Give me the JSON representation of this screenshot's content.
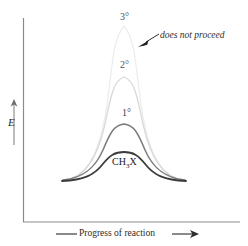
{
  "figure": {
    "type": "energy-diagram",
    "background_color": "#ffffff"
  },
  "axes": {
    "y_label": "E",
    "x_label": "Progress of reaction",
    "y_axis_name": "energy-axis",
    "x_axis_name": "reaction-coordinate-axis",
    "axis_color": "#6a6a6a",
    "y_axis_x": 23,
    "y_axis_top": 18,
    "y_axis_bottom": 222,
    "x_axis_left": 23,
    "x_axis_right": 240,
    "x_axis_y": 222
  },
  "annotation": {
    "text": "does not proceed",
    "arrow_from_x": 160,
    "arrow_from_y": 36,
    "arrow_to_x": 139,
    "arrow_to_y": 46
  },
  "chart_data": {
    "type": "line",
    "title": "",
    "xlabel": "Progress of reaction",
    "ylabel": "E",
    "grid": false,
    "legend": "inline-labels",
    "xlim": [
      0,
      1
    ],
    "ylim": [
      0,
      1
    ],
    "note": "Activation energy barriers for SN2 reaction with increasing substitution; higher barrier means slower or no reaction.",
    "series": [
      {
        "name": "3°",
        "label": "3°",
        "label_x": 120,
        "label_y": 12,
        "color": "#ededed",
        "peak_height_px": 25,
        "peak_x_px": 124,
        "width": "narrow",
        "relative_barrier": 1.0,
        "annotation": "does not proceed"
      },
      {
        "name": "2°",
        "label": "2°",
        "label_x": 120,
        "label_y": 60,
        "color": "#d8d8d8",
        "peak_height_px": 76,
        "peak_x_px": 124,
        "width": "medium-narrow",
        "relative_barrier": 0.73
      },
      {
        "name": "1°",
        "label": "1°",
        "label_x": 122,
        "label_y": 108,
        "color": "#7b7b7b",
        "peak_height_px": 124,
        "peak_x_px": 124,
        "width": "medium",
        "relative_barrier": 0.45
      },
      {
        "name": "CH3X",
        "label": "CH₃X",
        "label_x": 112,
        "label_y": 157,
        "color": "#3c3c3c",
        "peak_height_px": 152,
        "peak_x_px": 124,
        "width": "wide",
        "relative_barrier": 0.21
      }
    ],
    "categories": [
      "CH3X",
      "1°",
      "2°",
      "3°"
    ],
    "values": [
      0.21,
      0.45,
      0.73,
      1.0
    ]
  },
  "labels": {
    "tertiary": "3°",
    "secondary": "2°",
    "primary": "1°",
    "methyl_prefix": "CH",
    "methyl_sub": "3",
    "methyl_suffix": "X"
  }
}
